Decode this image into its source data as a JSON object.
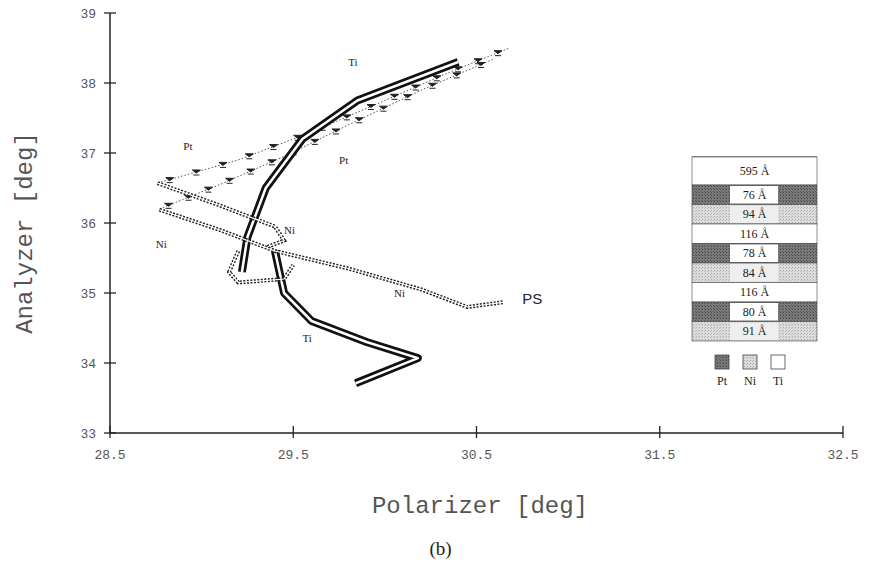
{
  "chart_data": {
    "type": "line",
    "title": "",
    "xlabel": "Polarizer [deg]",
    "ylabel": "Analyzer [deg]",
    "caption": "(b)",
    "xlim": [
      28.5,
      32.5
    ],
    "ylim": [
      33,
      39
    ],
    "xticks": [
      "28.5",
      "29.5",
      "30.5",
      "31.5",
      "32.5"
    ],
    "yticks": [
      "33",
      "34",
      "35",
      "36",
      "37",
      "38",
      "39"
    ],
    "grid": false,
    "series": [
      {
        "name": "Pt (upper)",
        "style": "dotted-arrow",
        "x": [
          28.76,
          29.2,
          29.6,
          30.0,
          30.35,
          30.68
        ],
        "y": [
          36.57,
          36.9,
          37.3,
          37.75,
          38.15,
          38.5
        ]
      },
      {
        "name": "Pt (lower)",
        "style": "dotted-arrow",
        "x": [
          28.77,
          29.1,
          29.45,
          29.8,
          30.2,
          30.6
        ],
        "y": [
          36.2,
          36.55,
          36.95,
          37.4,
          37.9,
          38.35
        ]
      },
      {
        "name": "Ti (outer)",
        "style": "thick-double",
        "x": [
          29.22,
          29.25,
          29.35,
          29.55,
          29.85,
          30.2,
          30.4
        ],
        "y": [
          35.3,
          35.8,
          36.5,
          37.2,
          37.75,
          38.1,
          38.3
        ]
      },
      {
        "name": "Ti (lower tail)",
        "style": "thick-double",
        "x": [
          29.4,
          29.45,
          29.6,
          29.9,
          30.18,
          29.84
        ],
        "y": [
          35.6,
          35.0,
          34.6,
          34.3,
          34.07,
          33.71
        ]
      },
      {
        "name": "Ni (upper)",
        "style": "dotted-double",
        "x": [
          28.76,
          29.1,
          29.4,
          29.45,
          29.35
        ],
        "y": [
          36.57,
          36.25,
          35.95,
          35.75,
          35.65
        ]
      },
      {
        "name": "Ni (lower)",
        "style": "dotted-double",
        "x": [
          28.77,
          29.1,
          29.4,
          29.8,
          30.2,
          30.45,
          30.65
        ],
        "y": [
          36.19,
          35.9,
          35.6,
          35.35,
          35.05,
          34.8,
          34.87
        ]
      },
      {
        "name": "Ni (loop)",
        "style": "dotted-double",
        "x": [
          29.2,
          29.15,
          29.2,
          29.45,
          29.5
        ],
        "y": [
          35.6,
          35.3,
          35.15,
          35.2,
          35.4
        ]
      }
    ],
    "annotations": [
      {
        "text": "Ti",
        "x": 29.8,
        "y": 38.25
      },
      {
        "text": "Pt",
        "x": 28.9,
        "y": 37.05
      },
      {
        "text": "Pt",
        "x": 29.75,
        "y": 36.85
      },
      {
        "text": "Ni",
        "x": 29.45,
        "y": 35.85
      },
      {
        "text": "Ni",
        "x": 28.75,
        "y": 35.65
      },
      {
        "text": "Ni",
        "x": 30.05,
        "y": 34.95
      },
      {
        "text": "Ti",
        "x": 29.55,
        "y": 34.3
      },
      {
        "text": "PS",
        "x": 30.75,
        "y": 34.85
      }
    ],
    "inset_legend": {
      "layers": [
        {
          "label": "595 Å",
          "material": "Ti"
        },
        {
          "label": "76 Å",
          "material": "Pt"
        },
        {
          "label": "94 Å",
          "material": "Ni"
        },
        {
          "label": "116 Å",
          "material": "Ti"
        },
        {
          "label": "78 Å",
          "material": "Pt"
        },
        {
          "label": "84 Å",
          "material": "Ni"
        },
        {
          "label": "116 Å",
          "material": "Ti"
        },
        {
          "label": "80 Å",
          "material": "Pt"
        },
        {
          "label": "91 Å",
          "material": "Ni"
        }
      ],
      "key": [
        {
          "label": "Pt",
          "color": "#6a6a6a"
        },
        {
          "label": "Ni",
          "color": "#cfcfcf"
        },
        {
          "label": "Ti",
          "color": "#ffffff"
        }
      ]
    }
  }
}
